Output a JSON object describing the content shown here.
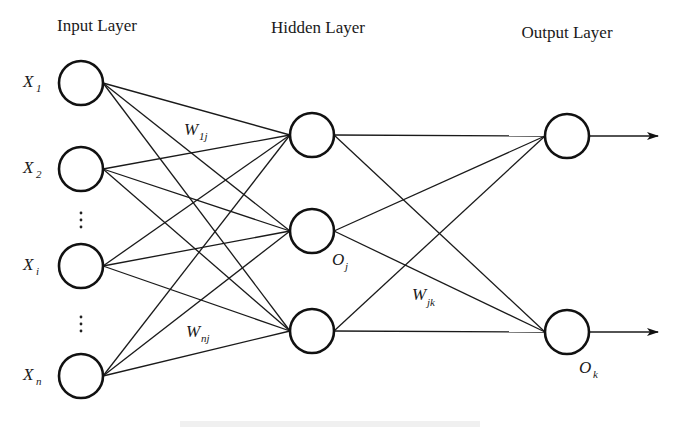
{
  "diagram": {
    "type": "feedforward-neural-network",
    "colors": {
      "stroke": "#111111",
      "background": "#ffffff"
    },
    "layers": [
      {
        "title": "Input Layer",
        "title_pos": [
          97,
          31
        ]
      },
      {
        "title": "Hidden Layer",
        "title_pos": [
          318,
          33
        ]
      },
      {
        "title": "Output Layer",
        "title_pos": [
          567,
          38
        ]
      }
    ],
    "node_radius": 22,
    "input_nodes": [
      {
        "label": "X",
        "sub": "1",
        "cx": 81,
        "cy": 83
      },
      {
        "label": "X",
        "sub": "2",
        "cx": 81,
        "cy": 169
      },
      {
        "label": "X",
        "sub": "i",
        "cx": 81,
        "cy": 266
      },
      {
        "label": "X",
        "sub": "n",
        "cx": 81,
        "cy": 376
      }
    ],
    "ellipsis_positions": [
      [
        81,
        220
      ],
      [
        81,
        324
      ]
    ],
    "hidden_nodes": [
      {
        "cx": 312,
        "cy": 135
      },
      {
        "cx": 312,
        "cy": 231
      },
      {
        "cx": 312,
        "cy": 331
      }
    ],
    "output_nodes": [
      {
        "cx": 567,
        "cy": 136
      },
      {
        "cx": 567,
        "cy": 332
      }
    ],
    "labels": {
      "w1j": {
        "main": "W",
        "sub": "1j"
      },
      "wnj": {
        "main": "W",
        "sub": "nj"
      },
      "wjk": {
        "main": "W",
        "sub": "jk"
      },
      "oj": {
        "main": "O",
        "sub": "j"
      },
      "ok": {
        "main": "O",
        "sub": "k"
      }
    },
    "connections": "fully-connected input→hidden and hidden→output; arrows out of each output node"
  }
}
